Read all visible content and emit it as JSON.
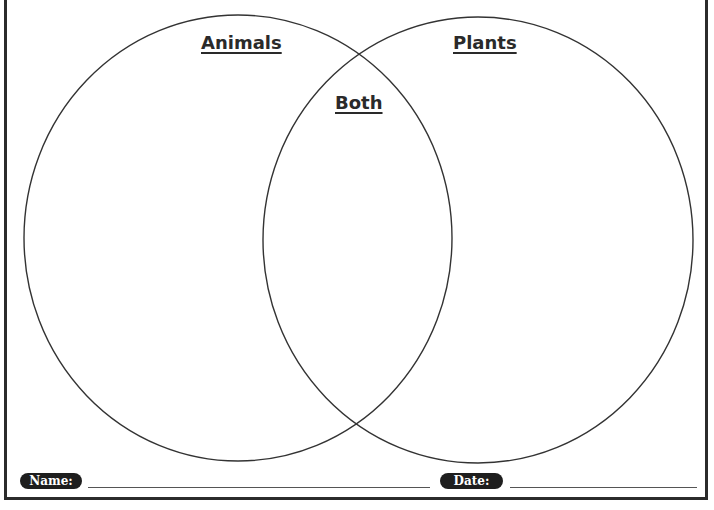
{
  "worksheet": {
    "diagram_type": "venn",
    "circles": [
      {
        "label": "Animals",
        "cx": 238,
        "cy": 238,
        "rx": 214,
        "ry": 223
      },
      {
        "label": "Plants",
        "cx": 478,
        "cy": 240,
        "rx": 215,
        "ry": 223
      }
    ],
    "overlap_label": "Both",
    "stroke_color": "#333333"
  },
  "footer": {
    "name_label": "Name:",
    "date_label": "Date:"
  }
}
